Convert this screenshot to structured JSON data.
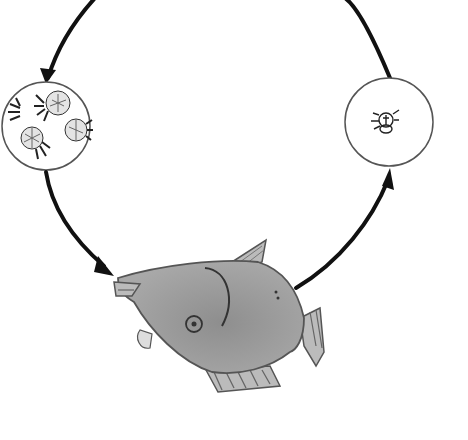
{
  "diagram": {
    "type": "life-cycle",
    "direction": "counter-clockwise arrows: top arc down-left to left circle, left circle down to fish, fish up-right to right circle, right circle up over top back to left",
    "stages": [
      {
        "id": "left-circle",
        "description": "magnified cluster of flower-like organisms with tentacles (parasite colony)",
        "icon": "organism-cluster-icon"
      },
      {
        "id": "fish",
        "description": "grey fish host with small eye and curved gill line",
        "icon": "fish-icon"
      },
      {
        "id": "right-circle",
        "description": "magnified single small larva/mite-like organism",
        "icon": "larva-icon"
      }
    ],
    "arrows": [
      {
        "from": "right-circle",
        "to": "left-circle",
        "path": "top arc"
      },
      {
        "from": "left-circle",
        "to": "fish"
      },
      {
        "from": "fish",
        "to": "right-circle"
      }
    ],
    "colors": {
      "background": "#ffffff",
      "stroke": "#111111",
      "fish_fill": "#9a9a9a",
      "fish_outline": "#444444",
      "circle_outline": "#555555"
    }
  }
}
